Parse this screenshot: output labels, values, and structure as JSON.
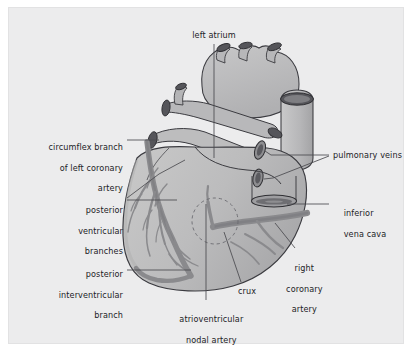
{
  "figure": {
    "kind": "anatomical-diagram",
    "background_color": "#ececed",
    "page_color": "#ffffff",
    "border_color": "#e2e2e3"
  },
  "palette": {
    "heart_fill": "#b9b9ba",
    "heart_fill_light": "#c6c6c6",
    "heart_fill_dark": "#ababac",
    "outline": "#3b3b40",
    "vessel": "#8e8e90",
    "vessel_dark": "#6f6f72",
    "lumen": "#55555a",
    "leader": "#4a4a4f",
    "text": "#222226"
  },
  "labels": [
    {
      "id": "left-atrium",
      "text": "left atrium",
      "lines": [
        "left atrium"
      ],
      "align": "center",
      "x": 166,
      "y": 22,
      "w": 78
    },
    {
      "id": "circumflex-branch",
      "text": "circumflex branch of left coronary artery",
      "lines": [
        "circumflex branch",
        "of left coronary",
        "artery"
      ],
      "align": "right",
      "x": 8,
      "y": 124,
      "w": 106
    },
    {
      "id": "posterior-ventricular-branches",
      "text": "posterior ventricular branches",
      "lines": [
        "posterior",
        "ventricular",
        "branches"
      ],
      "align": "right",
      "x": 18,
      "y": 187,
      "w": 96
    },
    {
      "id": "posterior-interventricular-branch",
      "text": "posterior interventricular branch",
      "lines": [
        "posterior",
        "interventricular",
        "branch"
      ],
      "align": "right",
      "x": 10,
      "y": 251,
      "w": 104
    },
    {
      "id": "atrioventricular-nodal-artery",
      "text": "atrioventricular nodal artery",
      "lines": [
        "atrioventricular",
        "nodal artery"
      ],
      "align": "center",
      "x": 148,
      "y": 296,
      "w": 98
    },
    {
      "id": "crux",
      "text": "crux",
      "lines": [
        "crux"
      ],
      "align": "center",
      "x": 222,
      "y": 278,
      "w": 32
    },
    {
      "id": "right-coronary-artery",
      "text": "right coronary artery",
      "lines": [
        "right",
        "coronary",
        "artery"
      ],
      "align": "center",
      "x": 262,
      "y": 245,
      "w": 56
    },
    {
      "id": "pulmonary-veins",
      "text": "pulmonary veins",
      "lines": [
        "pulmonary veins"
      ],
      "align": "left",
      "x": 324,
      "y": 142,
      "w": 88
    },
    {
      "id": "inferior-vena-cava",
      "text": "inferior vena cava",
      "lines": [
        "inferior",
        "vena cava"
      ],
      "align": "left",
      "x": 324,
      "y": 190,
      "w": 62
    }
  ]
}
